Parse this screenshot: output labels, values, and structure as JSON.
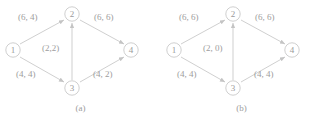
{
  "figure": {
    "type": "flow-network-diagram",
    "colors": {
      "line": "#c9c9c9",
      "text": "#9d9d9d",
      "background": "#ffffff"
    },
    "panels": [
      {
        "id": "a",
        "caption": "(a)",
        "nodes": [
          {
            "id": "1",
            "label": "1",
            "x": 13,
            "y": 50
          },
          {
            "id": "2",
            "label": "2",
            "x": 72,
            "y": 14
          },
          {
            "id": "3",
            "label": "3",
            "x": 72,
            "y": 88
          },
          {
            "id": "4",
            "label": "4",
            "x": 131,
            "y": 50
          },
          {
            "id": "1b",
            "label": "1",
            "x": 13,
            "y": 50
          }
        ],
        "edges": [
          {
            "from": "1",
            "to": "2",
            "label": "(6, 4)",
            "lx": 18,
            "ly": 12
          },
          {
            "from": "2",
            "to": "4",
            "label": "(6, 6)",
            "lx": 94,
            "ly": 12
          },
          {
            "from": "1",
            "to": "3",
            "label": "(4, 4)",
            "lx": 16,
            "ly": 69
          },
          {
            "from": "3",
            "to": "4",
            "label": "(4, 2)",
            "lx": 93,
            "ly": 69
          },
          {
            "from": "3",
            "to": "2",
            "label": "(2,2)",
            "lx": 42,
            "ly": 43
          }
        ]
      },
      {
        "id": "b",
        "caption": "(b)",
        "nodes": [
          {
            "id": "1",
            "label": "1",
            "x": 13,
            "y": 50
          },
          {
            "id": "2",
            "label": "2",
            "x": 72,
            "y": 14
          },
          {
            "id": "3",
            "label": "3",
            "x": 72,
            "y": 88
          },
          {
            "id": "4",
            "label": "4",
            "x": 131,
            "y": 50
          }
        ],
        "edges": [
          {
            "from": "1",
            "to": "2",
            "label": "(6, 6)",
            "lx": 18,
            "ly": 12
          },
          {
            "from": "2",
            "to": "4",
            "label": "(6, 6)",
            "lx": 94,
            "ly": 12
          },
          {
            "from": "1",
            "to": "3",
            "label": "(4, 4)",
            "lx": 16,
            "ly": 69
          },
          {
            "from": "3",
            "to": "4",
            "label": "(4, 4)",
            "lx": 93,
            "ly": 69
          },
          {
            "from": "3",
            "to": "2",
            "label": "(2, 0)",
            "lx": 42,
            "ly": 43
          }
        ]
      }
    ]
  }
}
